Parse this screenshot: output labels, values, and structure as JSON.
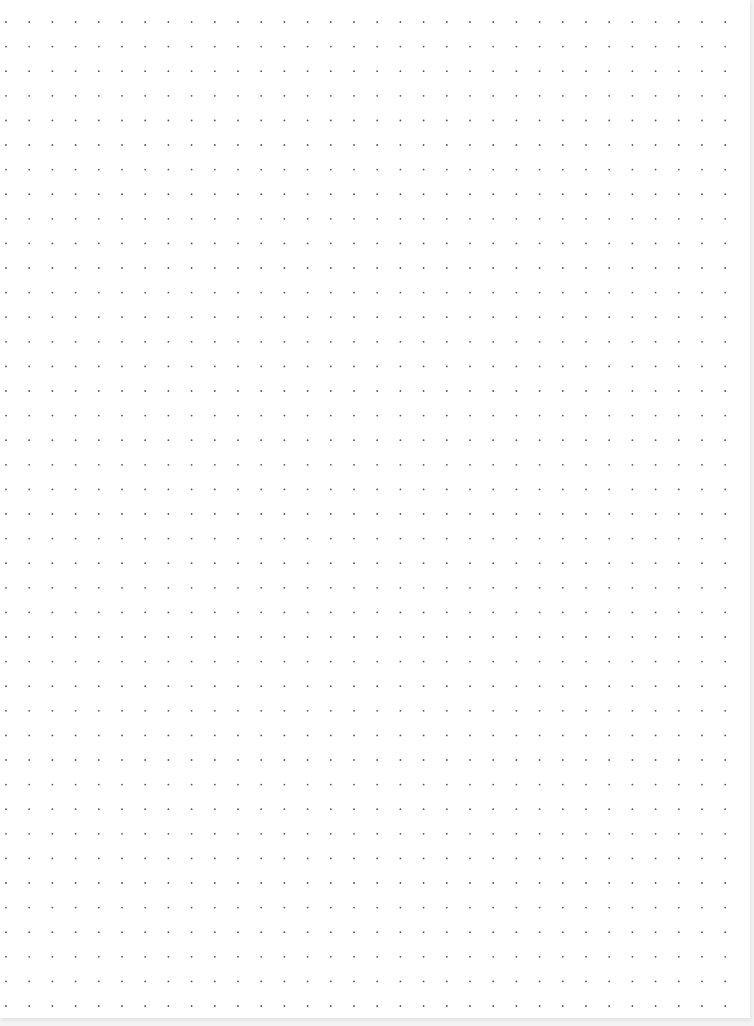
{
  "page": {
    "type": "dot-grid-paper",
    "background_color": "#ffffff",
    "dot_color": "#555555"
  },
  "grid": {
    "columns": 32,
    "rows": 41,
    "first_dot_x": 6,
    "first_dot_y": 22,
    "spacing_x": 23.2,
    "spacing_y": 24.6,
    "dot_radius": 0.9
  }
}
